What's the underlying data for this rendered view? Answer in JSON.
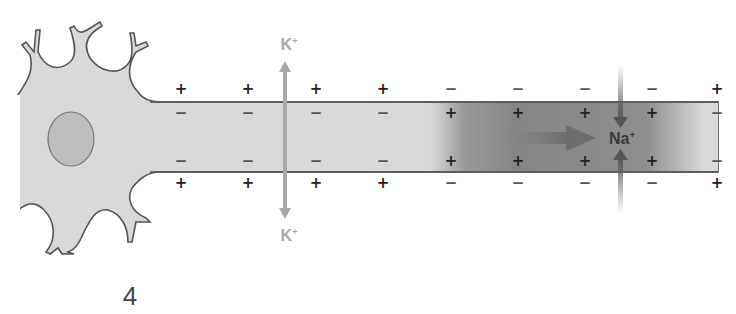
{
  "figure": {
    "step_label": "4",
    "colors": {
      "cytoplasm": "#d9d9d9",
      "membrane": "#555555",
      "nucleus": "#bdbdbd",
      "depolarized_region": "#8a8a8a",
      "k_ion": "#a8a8a8",
      "na_ion": "#3a3a3a",
      "na_arrow": "#7a7a7a"
    },
    "ions": {
      "k_top": {
        "symbol": "K",
        "charge": "+"
      },
      "k_bottom": {
        "symbol": "K",
        "charge": "+"
      },
      "na": {
        "symbol": "Na",
        "charge": "+"
      }
    },
    "charges": {
      "outside_top": [
        {
          "x": 181,
          "s": "+"
        },
        {
          "x": 248,
          "s": "+"
        },
        {
          "x": 316,
          "s": "+"
        },
        {
          "x": 383,
          "s": "+"
        },
        {
          "x": 451,
          "s": "−"
        },
        {
          "x": 518,
          "s": "−"
        },
        {
          "x": 585,
          "s": "−"
        },
        {
          "x": 652,
          "s": "−"
        },
        {
          "x": 717,
          "s": "+"
        }
      ],
      "inside_top": [
        {
          "x": 181,
          "s": "−"
        },
        {
          "x": 248,
          "s": "−"
        },
        {
          "x": 316,
          "s": "−"
        },
        {
          "x": 383,
          "s": "−"
        },
        {
          "x": 451,
          "s": "+"
        },
        {
          "x": 518,
          "s": "+"
        },
        {
          "x": 585,
          "s": "+"
        },
        {
          "x": 652,
          "s": "+"
        },
        {
          "x": 717,
          "s": "−"
        }
      ],
      "inside_bottom": [
        {
          "x": 181,
          "s": "−"
        },
        {
          "x": 248,
          "s": "−"
        },
        {
          "x": 316,
          "s": "−"
        },
        {
          "x": 383,
          "s": "−"
        },
        {
          "x": 451,
          "s": "+"
        },
        {
          "x": 518,
          "s": "+"
        },
        {
          "x": 585,
          "s": "+"
        },
        {
          "x": 652,
          "s": "+"
        },
        {
          "x": 717,
          "s": "−"
        }
      ],
      "outside_bottom": [
        {
          "x": 181,
          "s": "+"
        },
        {
          "x": 248,
          "s": "+"
        },
        {
          "x": 316,
          "s": "+"
        },
        {
          "x": 383,
          "s": "+"
        },
        {
          "x": 451,
          "s": "−"
        },
        {
          "x": 518,
          "s": "−"
        },
        {
          "x": 585,
          "s": "−"
        },
        {
          "x": 652,
          "s": "−"
        },
        {
          "x": 717,
          "s": "+"
        }
      ]
    }
  }
}
